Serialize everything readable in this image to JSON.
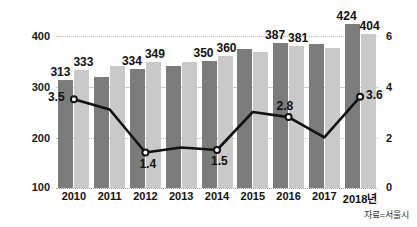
{
  "header": {
    "clipped_text": ""
  },
  "source_note": "자료=서울시",
  "chart_data": {
    "type": "bar",
    "title": "",
    "subtitle": "",
    "xlabel": "",
    "ylabel": "",
    "categories": [
      "2010",
      "2011",
      "2012",
      "2013",
      "2014",
      "2015",
      "2016",
      "2017",
      "2018년"
    ],
    "grid": true,
    "legend_position": "none",
    "left_axis": {
      "ticks": [
        100,
        200,
        300,
        400
      ],
      "ylim": [
        100,
        440
      ],
      "tick_labels": [
        "100",
        "200",
        "300",
        "400"
      ]
    },
    "right_axis": {
      "ticks": [
        0,
        2,
        4,
        6
      ],
      "ylim": [
        0,
        6.7
      ],
      "tick_labels": [
        "0",
        "2",
        "4",
        "6"
      ]
    },
    "series": [
      {
        "name": "dark-bars",
        "type": "bar",
        "axis": "left",
        "color": "#7c7c7c",
        "values": [
          313,
          320,
          334,
          341,
          350,
          374,
          387,
          385,
          424
        ],
        "labels": [
          "313",
          "",
          "334",
          "",
          "350",
          "",
          "387",
          "",
          "424"
        ]
      },
      {
        "name": "light-bars",
        "type": "bar",
        "axis": "left",
        "color": "#c9c9c9",
        "values": [
          333,
          340,
          349,
          348,
          360,
          368,
          381,
          377,
          404
        ],
        "labels": [
          "333",
          "",
          "349",
          "",
          "360",
          "",
          "381",
          "",
          "404"
        ]
      },
      {
        "name": "rate-line",
        "type": "line",
        "axis": "right",
        "color": "#111111",
        "marker": "circle",
        "values": [
          3.5,
          3.1,
          1.4,
          1.6,
          1.5,
          3.0,
          2.8,
          2.0,
          3.6
        ],
        "labels": [
          "3.5",
          "",
          "1.4",
          "",
          "1.5",
          "",
          "2.8",
          "",
          "3.6"
        ]
      }
    ]
  }
}
